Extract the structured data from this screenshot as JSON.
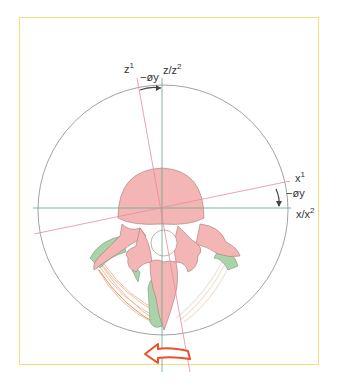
{
  "labels": {
    "z1": "z",
    "z1_sup": "1",
    "theta_top": "−øy",
    "z_z2": "z/z",
    "z_z2_sup": "2",
    "x1": "x",
    "x1_sup": "1",
    "theta_right": "−øy",
    "x_x2": "x/x",
    "x_x2_sup": "2"
  },
  "colors": {
    "frame": "#f3de7a",
    "axis_original": "#6fae8f",
    "axis_rotated": "#e48aa2",
    "circle": "#8a8a8a",
    "vertebra_body": "#f3b6b4",
    "cartilage": "#a9d3a9",
    "muscle": "#eeb08a",
    "rotation_arrow": "#e8512a"
  },
  "icons": {
    "rotation_arrow": "curved-arrow-left-icon"
  }
}
